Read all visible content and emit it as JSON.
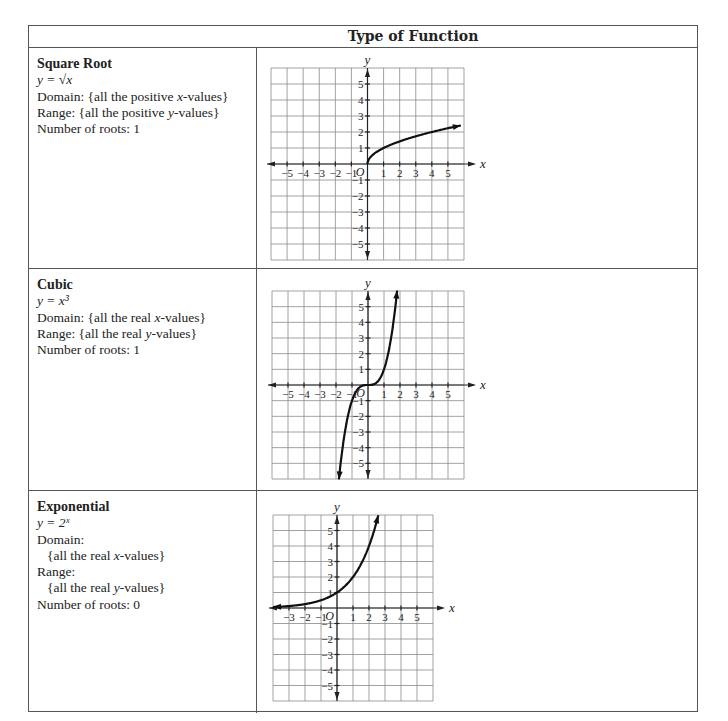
{
  "header": {
    "title": "Type of Function"
  },
  "rows": [
    {
      "title": "Square Root",
      "formula": "y = √x",
      "lines": [
        {
          "text": "Domain: {all the positive x-values}",
          "indent": false
        },
        {
          "text": "Range: {all the positive y-values}",
          "indent": false
        },
        {
          "text": "Number of roots: 1",
          "indent": false
        }
      ]
    },
    {
      "title": "Cubic",
      "formula": "y = x³",
      "lines": [
        {
          "text": "Domain: {all the real x-values}",
          "indent": false
        },
        {
          "text": "Range: {all the real y-values}",
          "indent": false
        },
        {
          "text": "Number of roots: 1",
          "indent": false
        }
      ]
    },
    {
      "title": "Exponential",
      "formula": "y = 2ˣ",
      "lines": [
        {
          "text": "Domain:",
          "indent": false
        },
        {
          "text": "{all the real x-values}",
          "indent": true
        },
        {
          "text": "Range:",
          "indent": false
        },
        {
          "text": "{all the real y-values}",
          "indent": true
        },
        {
          "text": "Number of roots: 0",
          "indent": false
        }
      ]
    }
  ],
  "chart_data": [
    {
      "type": "line",
      "title": "Square Root",
      "function": "sqrt",
      "xlabel": "x",
      "ylabel": "y",
      "origin_label": "O",
      "xlim": [
        -6,
        6
      ],
      "ylim": [
        -6,
        6
      ],
      "xticks": [
        -5,
        -4,
        -3,
        -2,
        -1,
        1,
        2,
        3,
        4,
        5
      ],
      "yticks": [
        -5,
        -4,
        -3,
        -2,
        -1,
        1,
        2,
        3,
        4,
        5
      ],
      "grid": true,
      "x": [
        0,
        0.25,
        1,
        2,
        3,
        4,
        5,
        6
      ],
      "y": [
        0,
        0.5,
        1,
        1.41,
        1.73,
        2,
        2.24,
        2.45
      ],
      "domain": [
        0,
        6
      ]
    },
    {
      "type": "line",
      "title": "Cubic",
      "function": "cube",
      "xlabel": "x",
      "ylabel": "y",
      "origin_label": "O",
      "xlim": [
        -6,
        6
      ],
      "ylim": [
        -6,
        6
      ],
      "xticks": [
        -5,
        -4,
        -3,
        -2,
        -1,
        1,
        2,
        3,
        4,
        5
      ],
      "yticks": [
        -5,
        -4,
        -3,
        -2,
        -1,
        1,
        2,
        3,
        4,
        5
      ],
      "grid": true,
      "x": [
        -1.82,
        -1.5,
        -1,
        -0.5,
        0,
        0.5,
        1,
        1.5,
        1.82
      ],
      "y": [
        -6,
        -3.38,
        -1,
        -0.13,
        0,
        0.13,
        1,
        3.38,
        6
      ],
      "domain": [
        -1.82,
        1.82
      ]
    },
    {
      "type": "line",
      "title": "Exponential",
      "function": "exp2",
      "xlabel": "x",
      "ylabel": "y",
      "origin_label": "O",
      "xlim": [
        -4,
        6
      ],
      "ylim": [
        -6,
        6
      ],
      "xticks": [
        -3,
        -2,
        -1,
        1,
        2,
        3,
        4,
        5
      ],
      "yticks": [
        -5,
        -4,
        -3,
        -2,
        -1,
        1,
        2,
        3,
        4,
        5
      ],
      "grid": true,
      "x": [
        -4,
        -3,
        -2,
        -1,
        0,
        1,
        2,
        2.58
      ],
      "y": [
        0.06,
        0.13,
        0.25,
        0.5,
        1,
        2,
        4,
        6
      ],
      "domain": [
        -4,
        2.58
      ]
    }
  ]
}
